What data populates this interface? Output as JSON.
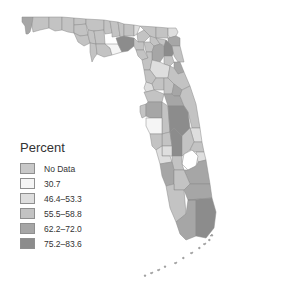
{
  "legend": {
    "title": "Percent",
    "items": [
      {
        "label": "No Data",
        "color": "#c8c8c8"
      },
      {
        "label": "30.7",
        "color": "#f5f5f5"
      },
      {
        "label": "46.4–53.3",
        "color": "#dedede"
      },
      {
        "label": "55.5–58.8",
        "color": "#c3c3c3"
      },
      {
        "label": "62.2–72.0",
        "color": "#a6a6a6"
      },
      {
        "label": "75.2–83.6",
        "color": "#8c8c8c"
      }
    ]
  },
  "map": {
    "region": "Florida",
    "unit": "counties",
    "colors": {
      "no_data": "#c8c8c8",
      "c1": "#f5f5f5",
      "c2": "#dedede",
      "c3": "#c3c3c3",
      "c4": "#a6a6a6",
      "c5": "#8c8c8c"
    }
  }
}
